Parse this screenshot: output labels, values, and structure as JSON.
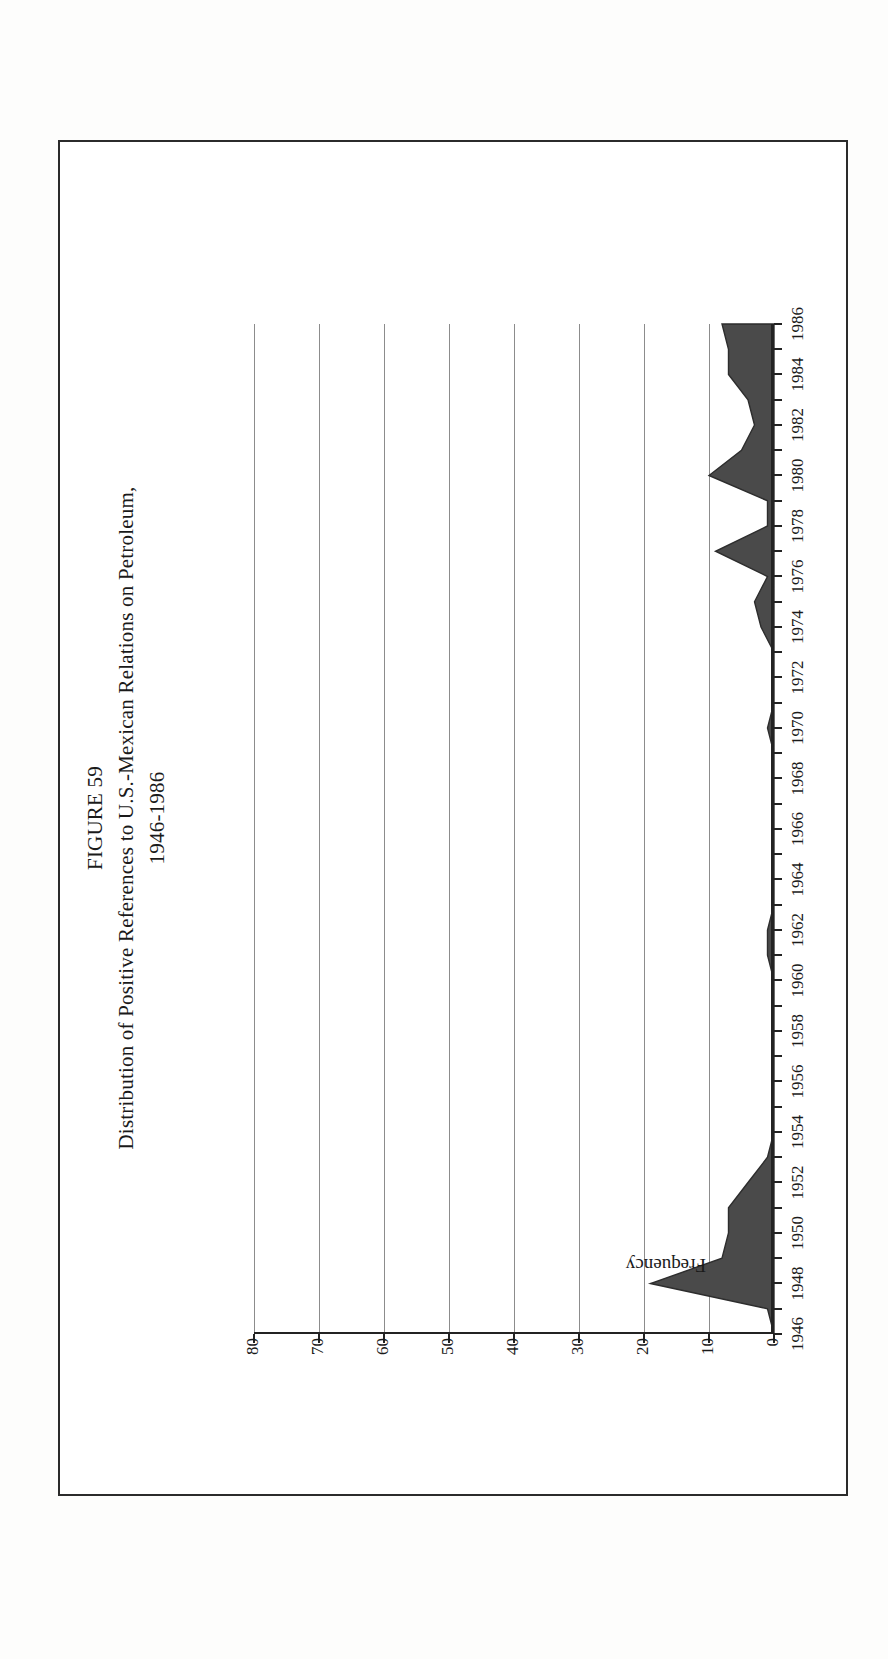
{
  "figure": {
    "number_label": "FIGURE 59",
    "title": "Distribution of Positive References to U.S.-Mexican Relations on Petroleum,",
    "subtitle": "1946-1986"
  },
  "axes": {
    "y_axis_title": "Frequency",
    "y_ticks": [
      "0",
      "10",
      "20",
      "30",
      "40",
      "50",
      "60",
      "70",
      "80"
    ],
    "x_ticks": [
      "1946",
      "1948",
      "1950",
      "1952",
      "1954",
      "1956",
      "1958",
      "1960",
      "1962",
      "1964",
      "1966",
      "1968",
      "1970",
      "1972",
      "1974",
      "1976",
      "1978",
      "1980",
      "1982",
      "1984",
      "1986"
    ]
  },
  "style": {
    "fill_color": "#4a4a4a",
    "axis_color": "#232323",
    "grid_color": "#8c8c8c",
    "frame_color": "#2b2b2b",
    "page_background": "#ffffff"
  },
  "chart_data": {
    "type": "area",
    "title": "Distribution of Positive References to U.S.-Mexican Relations on Petroleum, 1946-1986",
    "xlabel": "",
    "ylabel": "Frequency",
    "xlim": [
      1946,
      1986
    ],
    "ylim": [
      0,
      80
    ],
    "grid": true,
    "legend": "none",
    "x": [
      1946,
      1947,
      1948,
      1949,
      1950,
      1951,
      1952,
      1953,
      1954,
      1955,
      1956,
      1957,
      1958,
      1959,
      1960,
      1961,
      1962,
      1963,
      1964,
      1965,
      1966,
      1967,
      1968,
      1969,
      1970,
      1971,
      1972,
      1973,
      1974,
      1975,
      1976,
      1977,
      1978,
      1979,
      1980,
      1981,
      1982,
      1983,
      1984,
      1985,
      1986
    ],
    "values": [
      0,
      1,
      19,
      8,
      7,
      7,
      4,
      1,
      0,
      0,
      0,
      0,
      0,
      0,
      0,
      1,
      1,
      0,
      0,
      0,
      0,
      0,
      0,
      0,
      1,
      0,
      0,
      0,
      2,
      3,
      1,
      9,
      1,
      1,
      10,
      5,
      3,
      4,
      7,
      7,
      8
    ],
    "series": [
      {
        "name": "Positive references to U.S.-Mexican relations on petroleum",
        "values": [
          0,
          1,
          19,
          8,
          7,
          7,
          4,
          1,
          0,
          0,
          0,
          0,
          0,
          0,
          0,
          1,
          1,
          0,
          0,
          0,
          0,
          0,
          0,
          0,
          1,
          0,
          0,
          0,
          2,
          3,
          1,
          9,
          1,
          1,
          10,
          5,
          3,
          4,
          7,
          7,
          8
        ]
      }
    ],
    "peak": {
      "year": 1948,
      "value": 19
    }
  }
}
